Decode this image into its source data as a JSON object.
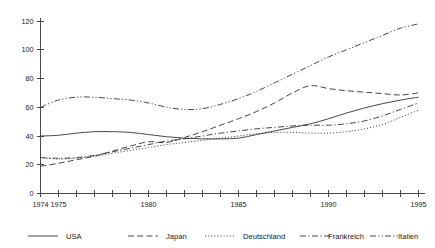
{
  "chart_data": {
    "type": "line",
    "title": "",
    "xlabel": "",
    "ylabel": "",
    "xlim": [
      1974,
      1995
    ],
    "ylim": [
      0,
      120
    ],
    "grid": false,
    "legend_position": "bottom",
    "x": [
      1974,
      1975,
      1976,
      1977,
      1978,
      1979,
      1980,
      1981,
      1982,
      1983,
      1984,
      1985,
      1986,
      1987,
      1988,
      1989,
      1990,
      1991,
      1992,
      1993,
      1994,
      1995
    ],
    "xtick_labels": [
      "1974",
      "1975",
      "1980",
      "1985",
      "1990",
      "1995"
    ],
    "xtick_values": [
      1974,
      1975,
      1980,
      1985,
      1990,
      1995
    ],
    "ytick_labels": [
      "0",
      "20",
      "40",
      "60",
      "80",
      "100",
      "120"
    ],
    "ytick_values": [
      0,
      20,
      40,
      60,
      80,
      100,
      120
    ],
    "series": [
      {
        "name": "USA",
        "style": "solid",
        "values": [
          40,
          40.5,
          42,
          43,
          43,
          42.5,
          41,
          39.5,
          38.5,
          38,
          38,
          38.5,
          41,
          43.5,
          46,
          48.5,
          52,
          56,
          59.5,
          62.5,
          65,
          67
        ]
      },
      {
        "name": "Japan",
        "style": "dashed",
        "values": [
          19,
          21,
          23.5,
          26,
          29.5,
          33,
          36,
          35.5,
          39,
          43,
          47.5,
          52,
          57,
          63,
          70,
          75,
          73,
          71.5,
          70.5,
          69.5,
          68.5,
          70
        ]
      },
      {
        "name": "Deutschland",
        "style": "dotted",
        "values": [
          25,
          24,
          24.5,
          26,
          28,
          30,
          32,
          34,
          35.5,
          37,
          38.5,
          40,
          41.5,
          42.5,
          42.5,
          42,
          42,
          43,
          45,
          48,
          53,
          58
        ]
      },
      {
        "name": "Frankreich",
        "style": "dashdot",
        "values": [
          25,
          24.5,
          25,
          26.5,
          29,
          31.5,
          34,
          36.5,
          38,
          40,
          42,
          43.5,
          45,
          46,
          47,
          47.5,
          47.5,
          48.5,
          50.5,
          54,
          58.5,
          63
        ]
      },
      {
        "name": "Italien",
        "style": "dashdotdot",
        "values": [
          60,
          65,
          67,
          67,
          66,
          65,
          63,
          60,
          58.5,
          59,
          62,
          66,
          71,
          77,
          83,
          89,
          95,
          100,
          105,
          110,
          115,
          118
        ]
      }
    ]
  },
  "legend": {
    "items": [
      {
        "label": "USA",
        "style": "solid"
      },
      {
        "label": "Japan",
        "style": "dashed"
      },
      {
        "label": "Deutschland",
        "style": "dotted"
      },
      {
        "label": "Frankreich",
        "style": "dashdot"
      },
      {
        "label": "Italien",
        "style": "dashdotdot"
      }
    ]
  }
}
